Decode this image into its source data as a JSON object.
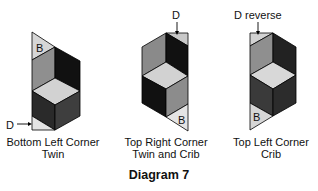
{
  "diagram": {
    "title": "Diagram 7",
    "colors": {
      "black": "#111111",
      "dark_gray": "#3a3a3a",
      "mid_gray": "#8c8c8c",
      "light_gray": "#d2d2d2",
      "pale": "#e6e6e6",
      "stroke": "#000000"
    },
    "panels": [
      {
        "caption_line1": "Bottom Left Corner",
        "caption_line2": "Twin",
        "corner_label": "B",
        "pointer_label": "D"
      },
      {
        "caption_line1": "Top Right Corner",
        "caption_line2": "Twin and Crib",
        "corner_label": "B",
        "pointer_label": "D"
      },
      {
        "caption_line1": "Top Left Corner",
        "caption_line2": "Crib",
        "corner_label": "B",
        "pointer_label": "D reverse"
      }
    ]
  }
}
